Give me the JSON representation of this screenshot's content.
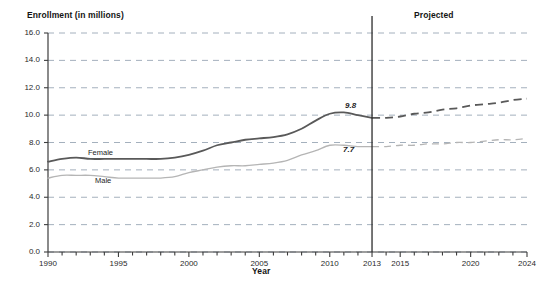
{
  "figure": {
    "y_axis_title": "Enrollment (in millions)",
    "x_axis_title": "Year",
    "projected_label": "Projected"
  },
  "chart_data": {
    "type": "line",
    "title": "",
    "xlabel": "Year",
    "ylabel": "Enrollment (in millions)",
    "xlim": [
      1990,
      2024
    ],
    "ylim": [
      0.0,
      16.0
    ],
    "grid": true,
    "legend": "inline-labels",
    "y_ticks": [
      "0.0",
      "2.0",
      "4.0",
      "6.0",
      "8.0",
      "10.0",
      "12.0",
      "14.0",
      "16.0"
    ],
    "y_tick_values": [
      0.0,
      2.0,
      4.0,
      6.0,
      8.0,
      10.0,
      12.0,
      14.0,
      16.0
    ],
    "x_ticks": [
      "1990",
      "1995",
      "2000",
      "2005",
      "2010",
      "2013",
      "2015",
      "2020",
      "2024"
    ],
    "x_tick_values": [
      1990,
      1995,
      2000,
      2005,
      2010,
      2013,
      2015,
      2020,
      2024
    ],
    "x_minor_tick_interval": 1,
    "projection_divider_year": 2013,
    "annotations": [
      {
        "name": "female-2013-value",
        "text": "9.8",
        "x": 2013,
        "y": 9.8
      },
      {
        "name": "male-2013-value",
        "text": "7.7",
        "x": 2013,
        "y": 7.7
      }
    ],
    "series": [
      {
        "name": "Female",
        "label": "Female",
        "color": "#595959",
        "actual": {
          "x": [
            1990,
            1991,
            1992,
            1993,
            1994,
            1995,
            1996,
            1997,
            1998,
            1999,
            2000,
            2001,
            2002,
            2003,
            2004,
            2005,
            2006,
            2007,
            2008,
            2009,
            2010,
            2011,
            2012,
            2013
          ],
          "y": [
            6.6,
            6.8,
            6.9,
            6.8,
            6.8,
            6.8,
            6.8,
            6.8,
            6.8,
            6.9,
            7.1,
            7.4,
            7.8,
            8.0,
            8.2,
            8.3,
            8.4,
            8.6,
            9.0,
            9.6,
            10.1,
            10.2,
            10.0,
            9.8
          ]
        },
        "projected": {
          "x": [
            2013,
            2014,
            2015,
            2016,
            2017,
            2018,
            2019,
            2020,
            2021,
            2022,
            2023,
            2024
          ],
          "y": [
            9.8,
            9.8,
            9.9,
            10.1,
            10.2,
            10.4,
            10.5,
            10.7,
            10.8,
            10.9,
            11.1,
            11.2
          ]
        }
      },
      {
        "name": "Male",
        "label": "Male",
        "color": "#b5b5b5",
        "actual": {
          "x": [
            1990,
            1991,
            1992,
            1993,
            1994,
            1995,
            1996,
            1997,
            1998,
            1999,
            2000,
            2001,
            2002,
            2003,
            2004,
            2005,
            2006,
            2007,
            2008,
            2009,
            2010,
            2011,
            2012,
            2013
          ],
          "y": [
            5.4,
            5.6,
            5.6,
            5.6,
            5.5,
            5.4,
            5.4,
            5.4,
            5.4,
            5.5,
            5.8,
            6.0,
            6.2,
            6.3,
            6.3,
            6.4,
            6.5,
            6.7,
            7.1,
            7.4,
            7.8,
            7.8,
            7.7,
            7.7
          ]
        },
        "projected": {
          "x": [
            2013,
            2014,
            2015,
            2016,
            2017,
            2018,
            2019,
            2020,
            2021,
            2022,
            2023,
            2024
          ],
          "y": [
            7.7,
            7.7,
            7.8,
            7.8,
            7.9,
            7.9,
            8.0,
            8.0,
            8.1,
            8.2,
            8.2,
            8.3
          ]
        }
      }
    ]
  },
  "colors": {
    "female_line": "#595959",
    "male_line": "#b5b5b5",
    "gridline": "#9aa7b5",
    "axis": "#3d3d3d",
    "divider": "#2b2b2b"
  }
}
